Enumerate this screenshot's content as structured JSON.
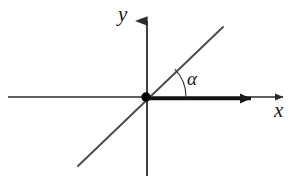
{
  "figure": {
    "type": "cartesian-axes-diagram",
    "background_color": "#ffffff",
    "stroke_color": "#2b2b2b",
    "accent_color": "#000000"
  },
  "labels": {
    "y_axis": "y",
    "x_axis": "x",
    "angle": "α"
  },
  "geometry": {
    "origin": {
      "x": 146,
      "y": 97
    },
    "x_axis": {
      "start": {
        "x": 8,
        "y": 97
      },
      "end": {
        "x": 290,
        "y": 97
      },
      "arrow_at_end": true,
      "stroke_width": 1.6
    },
    "y_axis": {
      "start": {
        "x": 147,
        "y": 176
      },
      "end": {
        "x": 147,
        "y": 9
      },
      "arrow_at_end": true,
      "stroke_width": 1.8
    },
    "ray": {
      "description": "thick ray along positive x-axis from origin",
      "start": {
        "x": 146,
        "y": 99
      },
      "end": {
        "x": 262,
        "y": 99
      },
      "arrow_at_end": true,
      "stroke_width": 3.4
    },
    "diagonal_line": {
      "description": "straight line through the origin at angle alpha",
      "start": {
        "x": 78,
        "y": 166
      },
      "end": {
        "x": 223,
        "y": 27
      },
      "stroke_width": 1.8,
      "angle_degrees": 44
    },
    "angle_arc": {
      "center": {
        "x": 146,
        "y": 97
      },
      "radius": 40,
      "start_angle_degrees": 0,
      "end_angle_degrees": 44,
      "stroke_width": 1.1
    },
    "origin_dot": {
      "cx": 146,
      "cy": 97,
      "r": 4.6
    }
  }
}
